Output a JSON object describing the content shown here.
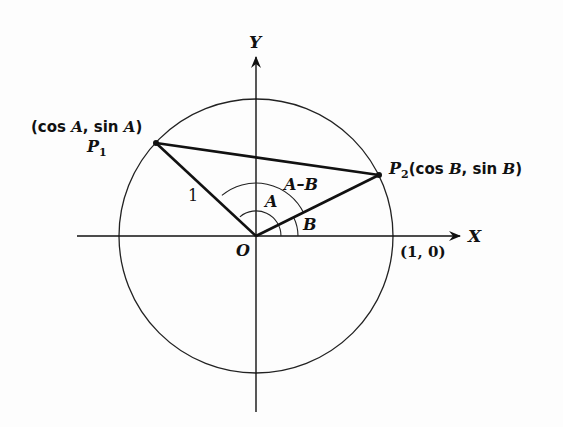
{
  "diagram": {
    "axes": {
      "x_label": "X",
      "y_label": "Y",
      "origin_label": "O",
      "unit_point_label": "(1, 0)"
    },
    "points": [
      {
        "name": "P",
        "sub": "1",
        "coord_label_open": "(cos ",
        "coord_var1": "A",
        "coord_mid": ", sin ",
        "coord_var2": "A",
        "coord_close": ")"
      },
      {
        "name": "P",
        "sub": "2",
        "coord_label_open": "(cos ",
        "coord_var1": "B",
        "coord_mid": ", sin ",
        "coord_var2": "B",
        "coord_close": ")"
      }
    ],
    "segment_label": "1",
    "angle_labels": {
      "a": "A",
      "b": "B",
      "a_minus_b": "A–B"
    },
    "colors": {
      "stroke": "#111111",
      "background": "#fdfdfd"
    }
  }
}
